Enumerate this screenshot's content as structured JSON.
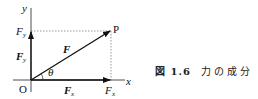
{
  "figure": {
    "labels": {
      "y_axis": "y",
      "x_axis": "x",
      "origin": "O",
      "point": "P",
      "force": "F",
      "angle": "θ",
      "fy_tick": "F",
      "fy_tick_sub": "y",
      "fy_vec": "F",
      "fy_vec_sub": "y",
      "fx_vec": "F",
      "fx_vec_sub": "x",
      "fx_tick": "F",
      "fx_tick_sub": "x"
    },
    "caption": {
      "number": "図 1.6",
      "text": "力の成分"
    }
  }
}
